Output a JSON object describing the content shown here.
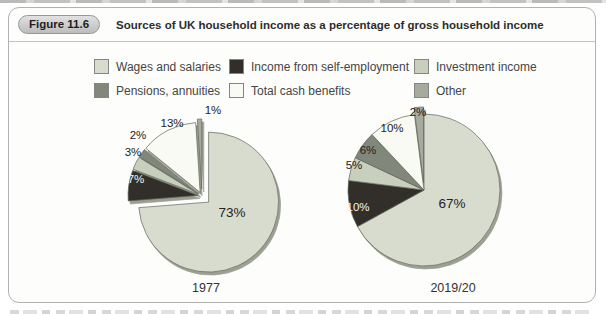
{
  "figure": {
    "badge": "Figure 11.6",
    "title": "Sources of UK household income as a percentage of gross household income"
  },
  "colors": {
    "wages": "#d8dcce",
    "self_employment": "#322f2b",
    "investment": "#c8cfbd",
    "pensions": "#82877b",
    "cash_benefits": "#f9faf3",
    "other": "#a6ab9e",
    "label_dark": "#222222",
    "label_light": "#f4f4f2"
  },
  "legend": {
    "items": [
      {
        "label": "Wages and salaries",
        "color_key": "wages"
      },
      {
        "label": "Income from self-employment",
        "color_key": "self_employment"
      },
      {
        "label": "Investment income",
        "color_key": "investment"
      },
      {
        "label": "Pensions, annuities",
        "color_key": "pensions"
      },
      {
        "label": "Total cash benefits",
        "color_key": "cash_benefits"
      },
      {
        "label": "Other",
        "color_key": "other"
      }
    ]
  },
  "chart_data": [
    {
      "type": "pie",
      "title": "1977",
      "categories": [
        "Wages and salaries",
        "Income from self-employment",
        "Investment income",
        "Pensions, annuities",
        "Total cash benefits",
        "Other"
      ],
      "values": [
        73,
        7,
        3,
        2,
        13,
        1
      ],
      "value_labels": [
        "73%",
        "7%",
        "3%",
        "2%",
        "13%",
        "1%"
      ],
      "unit": "%",
      "start_angle_deg": 0,
      "direction": "clockwise",
      "exploded": true,
      "legend_position": "top"
    },
    {
      "type": "pie",
      "title": "2019/20",
      "categories": [
        "Wages and salaries",
        "Income from self-employment",
        "Investment income",
        "Pensions, annuities",
        "Total cash benefits",
        "Other"
      ],
      "values": [
        67,
        10,
        5,
        6,
        10,
        2
      ],
      "value_labels": [
        "67%",
        "10%",
        "5%",
        "6%",
        "10%",
        "2%"
      ],
      "unit": "%",
      "start_angle_deg": 0,
      "direction": "clockwise",
      "exploded": "other-slice-only",
      "legend_position": "top"
    }
  ]
}
